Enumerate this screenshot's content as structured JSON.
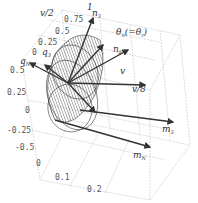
{
  "diagram": {
    "type": "3d-plot",
    "labels": {
      "v_half": "v/2",
      "one": "1",
      "n3": "n",
      "n3_sub": "3",
      "theta": "θ",
      "theta_sub": "n",
      "theta_eq": "(=θ",
      "theta_eq_sub": "r",
      "theta_close": ")",
      "q3": "q",
      "q3_sub": "3",
      "n_perp": "n",
      "n_perp_sub": "β",
      "qN": "q",
      "qN_sub": "N",
      "v": "v",
      "v8": "v/8",
      "m3": "m",
      "m3_sub": "3",
      "mN": "m",
      "mN_sub": "N"
    },
    "ticks": {
      "top_axis": [
        "0.75",
        "0.5",
        "0.25",
        "0"
      ],
      "left_axis": [
        "0.5",
        "0.25",
        "0",
        "-0.25",
        "-0.5"
      ],
      "bottom_axis": [
        "0",
        "0.1",
        "0.2"
      ]
    },
    "colors": {
      "line": "#222222",
      "grid": "#bbbbbb",
      "arrow": "#333333"
    }
  }
}
